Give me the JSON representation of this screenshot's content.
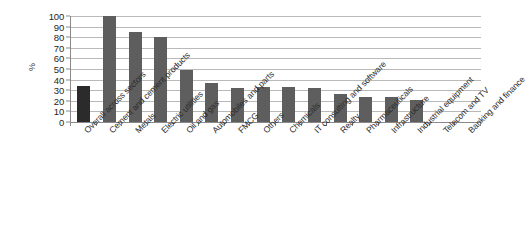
{
  "chart_data": {
    "type": "bar",
    "title": "",
    "subtitle": "",
    "xlabel": "",
    "ylabel": "%",
    "ylim": [
      0,
      100
    ],
    "grid": true,
    "legend": "none",
    "y_ticks": [
      0,
      10,
      20,
      30,
      40,
      50,
      60,
      70,
      80,
      90,
      100
    ],
    "categories": [
      "Overall across sectors",
      "Cement and cement products",
      "Metals",
      "Electric utilities",
      "Oil and gas",
      "Automobiles and parts",
      "FMCG",
      "Others",
      "Chemicals",
      "IT consulting and software",
      "Realty",
      "Pharmaceuticals",
      "Infrastructure",
      "Industrial equipment",
      "Telecom and TV",
      "Banking and finance"
    ],
    "values": [
      34,
      100,
      85,
      80,
      49,
      37,
      32,
      33,
      33,
      32,
      26,
      24,
      24,
      21,
      0,
      0
    ],
    "highlight_index": 0,
    "colors": {
      "bar": "#5e5e5e",
      "bar_highlight": "#2b2b2b",
      "gridline": "#b9b9b9",
      "axis": "#8a8a8a",
      "text": "#2c2c2c",
      "background": "#ffffff"
    }
  }
}
